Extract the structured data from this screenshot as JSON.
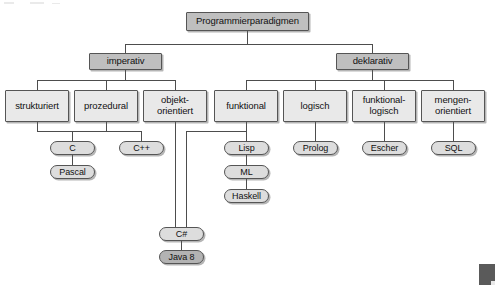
{
  "diagram": {
    "title": "Programmierparadigmen",
    "language": "de",
    "type": "hierarchy-tree",
    "colors": {
      "root_fill": "#bfbfbf",
      "level2_fill": "#bfbfbf",
      "level3_fill": "#e9e9e9",
      "leaf_fill": "#dddddd",
      "leaf_highlight_fill": "#b3b3b3",
      "border": "#555555",
      "line": "#4d4d4d",
      "background": "#ffffff",
      "corner_marker": "#5a5a5a"
    },
    "nodes": {
      "root": {
        "label": "Programmierparadigmen",
        "level": 1,
        "shape": "rect",
        "shade": "dark"
      },
      "imperativ": {
        "label": "imperativ",
        "level": 2,
        "shape": "rect",
        "shade": "dark"
      },
      "deklarativ": {
        "label": "deklarativ",
        "level": 2,
        "shape": "rect",
        "shade": "dark"
      },
      "strukturiert": {
        "label": "strukturiert",
        "level": 3,
        "shape": "rect",
        "shade": "light"
      },
      "prozedural": {
        "label": "prozedural",
        "level": 3,
        "shape": "rect",
        "shade": "light"
      },
      "objektorientiert": {
        "label": "objekt-\norientiert",
        "level": 3,
        "shape": "rect",
        "shade": "light"
      },
      "funktional": {
        "label": "funktional",
        "level": 3,
        "shape": "rect",
        "shade": "light"
      },
      "logisch": {
        "label": "logisch",
        "level": 3,
        "shape": "rect",
        "shade": "light"
      },
      "funktionallogisch": {
        "label": "funktional-\nlogisch",
        "level": 3,
        "shape": "rect",
        "shade": "light"
      },
      "mengenorientiert": {
        "label": "mengen-\norientiert",
        "level": 3,
        "shape": "rect",
        "shade": "light"
      },
      "c": {
        "label": "C",
        "level": 4,
        "shape": "pill",
        "shade": "light"
      },
      "pascal": {
        "label": "Pascal",
        "level": 5,
        "shape": "pill",
        "shade": "light"
      },
      "cpp": {
        "label": "C++",
        "level": 4,
        "shape": "pill",
        "shade": "light"
      },
      "csharp": {
        "label": "C#",
        "level": 6,
        "shape": "pill",
        "shade": "light"
      },
      "java8": {
        "label": "Java 8",
        "level": 7,
        "shape": "pill",
        "shade": "dark"
      },
      "lisp": {
        "label": "Lisp",
        "level": 4,
        "shape": "pill",
        "shade": "light"
      },
      "ml": {
        "label": "ML",
        "level": 5,
        "shape": "pill",
        "shade": "light"
      },
      "haskell": {
        "label": "Haskell",
        "level": 6,
        "shape": "pill",
        "shade": "light"
      },
      "prolog": {
        "label": "Prolog",
        "level": 4,
        "shape": "pill",
        "shade": "light"
      },
      "escher": {
        "label": "Escher",
        "level": 4,
        "shape": "pill",
        "shade": "light"
      },
      "sql": {
        "label": "SQL",
        "level": 4,
        "shape": "pill",
        "shade": "light"
      }
    },
    "edges": [
      {
        "from": "root",
        "to": "imperativ"
      },
      {
        "from": "root",
        "to": "deklarativ"
      },
      {
        "from": "imperativ",
        "to": "strukturiert"
      },
      {
        "from": "imperativ",
        "to": "prozedural"
      },
      {
        "from": "imperativ",
        "to": "objektorientiert"
      },
      {
        "from": "deklarativ",
        "to": "funktional"
      },
      {
        "from": "deklarativ",
        "to": "logisch"
      },
      {
        "from": "deklarativ",
        "to": "funktionallogisch"
      },
      {
        "from": "deklarativ",
        "to": "mengenorientiert"
      },
      {
        "from": "strukturiert",
        "to": "c"
      },
      {
        "from": "prozedural",
        "to": "c"
      },
      {
        "from": "prozedural",
        "to": "cpp"
      },
      {
        "from": "c",
        "to": "pascal"
      },
      {
        "from": "objektorientiert",
        "to": "csharp"
      },
      {
        "from": "funktional",
        "to": "csharp"
      },
      {
        "from": "csharp",
        "to": "java8"
      },
      {
        "from": "funktional",
        "to": "lisp"
      },
      {
        "from": "lisp",
        "to": "ml"
      },
      {
        "from": "ml",
        "to": "haskell"
      },
      {
        "from": "logisch",
        "to": "prolog"
      },
      {
        "from": "funktionallogisch",
        "to": "escher"
      },
      {
        "from": "mengenorientiert",
        "to": "sql"
      }
    ]
  }
}
